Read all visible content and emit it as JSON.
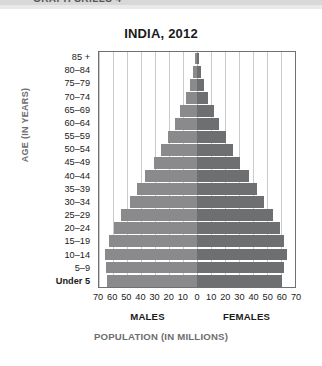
{
  "header": {
    "text": "GRAPH SKILLS 4"
  },
  "chart_data": {
    "type": "bar",
    "subtype": "population-pyramid",
    "title": "INDIA, 2012",
    "xlabel": "POPULATION (IN MILLIONS)",
    "ylabel": "AGE (IN YEARS)",
    "xlim": [
      -70,
      70
    ],
    "ylim": null,
    "grid": true,
    "legend_position": "below-axis",
    "axis_unit": "millions",
    "x_ticks": [
      70,
      60,
      50,
      40,
      30,
      20,
      10,
      0,
      10,
      20,
      30,
      40,
      50,
      60,
      70
    ],
    "x_tick_step": 10,
    "categories": [
      "85 +",
      "80–84",
      "75–79",
      "70–74",
      "65–69",
      "60–64",
      "55–59",
      "50–54",
      "45–49",
      "40–44",
      "35–39",
      "30–34",
      "25–29",
      "20–24",
      "15–19",
      "10–14",
      "5–9",
      "Under 5"
    ],
    "series": [
      {
        "name": "MALES",
        "side": "left",
        "color": "#8a8a8c",
        "values": [
          1.5,
          3,
          5,
          8,
          12,
          16,
          21,
          26,
          31,
          37,
          43,
          48,
          54,
          59,
          63,
          66,
          65,
          64
        ]
      },
      {
        "name": "FEMALES",
        "side": "right",
        "color": "#6e6f71",
        "values": [
          1.5,
          3,
          5,
          8,
          12,
          16,
          21,
          26,
          31,
          37,
          43,
          48,
          54,
          59,
          62,
          64,
          62,
          61
        ]
      }
    ]
  },
  "colors": {
    "male_bar": "#8a8a8c",
    "female_bar": "#6e6f71",
    "frame": "#6f7072",
    "gridline": "#c9cacc",
    "axis_title": "#6d6e71",
    "header_band": "#d8d8d8"
  }
}
